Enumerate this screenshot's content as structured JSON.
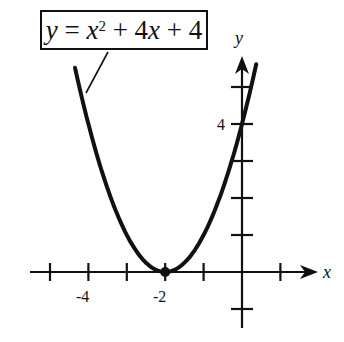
{
  "equation": {
    "y": "y",
    "eq": " = ",
    "x": "x",
    "exp": "2",
    "rest1": " + 4",
    "x2": "x",
    "rest2": " + 4",
    "full": "y = x^2 + 4x + 4"
  },
  "axes": {
    "x_label": "x",
    "y_label": "y"
  },
  "ticks": {
    "x_labels": [
      {
        "value": -4,
        "text": "-4"
      },
      {
        "value": -2,
        "text": "-2"
      }
    ],
    "y_labels": [
      {
        "value": 4,
        "text": "4"
      }
    ]
  },
  "chart_data": {
    "type": "line",
    "xlabel": "x",
    "ylabel": "y",
    "function": "x^2 + 4x + 4",
    "vertex": {
      "x": -2,
      "y": 0,
      "marked": true
    },
    "x_range": [
      -4.35,
      0.37
    ],
    "xlim": [
      -5.5,
      2
    ],
    "ylim": [
      -1.5,
      5.6
    ],
    "x_ticks": [
      -5,
      -4,
      -3,
      -2,
      -1,
      1
    ],
    "y_ticks": [
      -1,
      1,
      2,
      3,
      4,
      5
    ],
    "tick_labels": {
      "x": [
        "-4",
        "-2"
      ],
      "y": [
        "4"
      ]
    },
    "grid": false,
    "legend": "callout box with leader line pointing at curve"
  }
}
